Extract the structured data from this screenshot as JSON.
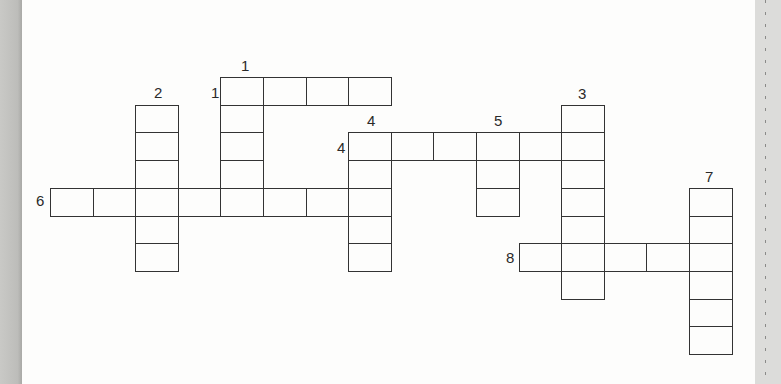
{
  "puzzle": {
    "type": "crossword",
    "grid_origin": {
      "x": 50,
      "y": 77
    },
    "cell_size": {
      "w": 42.6,
      "h": 27.7
    },
    "entries": [
      {
        "number": "1",
        "direction": "across",
        "row": 0,
        "col": 4,
        "length": 4
      },
      {
        "number": "1",
        "direction": "down",
        "row": 0,
        "col": 4,
        "length": 5
      },
      {
        "number": "2",
        "direction": "down",
        "row": 1,
        "col": 2,
        "length": 6
      },
      {
        "number": "3",
        "direction": "down",
        "row": 1,
        "col": 12,
        "length": 7
      },
      {
        "number": "4",
        "direction": "across",
        "row": 2,
        "col": 7,
        "length": 6
      },
      {
        "number": "4",
        "direction": "down",
        "row": 2,
        "col": 7,
        "length": 5
      },
      {
        "number": "5",
        "direction": "down",
        "row": 2,
        "col": 10,
        "length": 3
      },
      {
        "number": "6",
        "direction": "across",
        "row": 4,
        "col": 0,
        "length": 8
      },
      {
        "number": "7",
        "direction": "down",
        "row": 4,
        "col": 15,
        "length": 6
      },
      {
        "number": "8",
        "direction": "across",
        "row": 6,
        "col": 11,
        "length": 5
      }
    ],
    "labels": [
      {
        "text": "1",
        "x": 241,
        "y": 58
      },
      {
        "text": "1",
        "x": 211,
        "y": 85
      },
      {
        "text": "2",
        "x": 154,
        "y": 85
      },
      {
        "text": "3",
        "x": 578,
        "y": 86
      },
      {
        "text": "4",
        "x": 367,
        "y": 113
      },
      {
        "text": "4",
        "x": 337,
        "y": 140
      },
      {
        "text": "5",
        "x": 494,
        "y": 113
      },
      {
        "text": "6",
        "x": 36,
        "y": 193
      },
      {
        "text": "7",
        "x": 705,
        "y": 169
      },
      {
        "text": "8",
        "x": 506,
        "y": 250
      }
    ]
  }
}
